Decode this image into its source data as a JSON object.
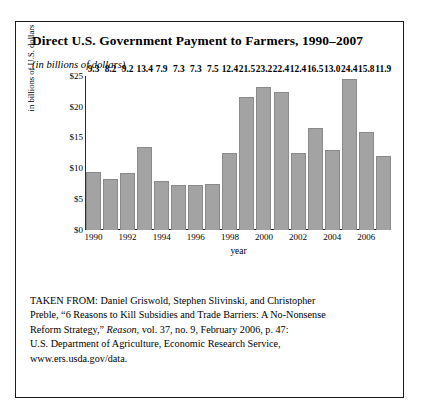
{
  "chart_title": "Direct U.S. Government Payment to Farmers, 1990–2007",
  "chart_subtitle": "(in billions of dollars)",
  "chart_data": {
    "type": "bar",
    "title": "Direct U.S. Government Payment to Farmers, 1990–2007",
    "subtitle": "(in billions of dollars)",
    "xlabel": "year",
    "ylabel": "in billions of U.S. dollars",
    "ylim": [
      0,
      25
    ],
    "yticks": [
      "$0",
      "$5",
      "$10",
      "$15",
      "$20",
      "$25"
    ],
    "ytick_values": [
      0,
      5,
      10,
      15,
      20,
      25
    ],
    "grid": false,
    "legend": "none",
    "bar_color": "#a3a3a3",
    "categories": [
      "1990",
      "1991",
      "1992",
      "1993",
      "1994",
      "1995",
      "1996",
      "1997",
      "1998",
      "1999",
      "2000",
      "2001",
      "2002",
      "2003",
      "2004",
      "2005",
      "2006",
      "2007"
    ],
    "visible_xtick_labels": [
      "1990",
      "",
      "1992",
      "",
      "1994",
      "",
      "1996",
      "",
      "1998",
      "",
      "2000",
      "",
      "2002",
      "",
      "2004",
      "",
      "2006",
      ""
    ],
    "values": [
      9.3,
      8.2,
      9.2,
      13.4,
      7.9,
      7.3,
      7.3,
      7.5,
      12.4,
      21.5,
      23.2,
      22.4,
      12.4,
      16.5,
      13.0,
      24.4,
      15.8,
      11.9
    ],
    "data_labels": [
      "9.3",
      "8.2",
      "9.2",
      "13.4",
      "7.9",
      "7.3",
      "7.3",
      "7.5",
      "12.4",
      "21.5",
      "23.2",
      "22.4",
      "12.4",
      "16.5",
      "13.0",
      "24.4",
      "15.8",
      "11.9"
    ]
  },
  "source": {
    "line1": "TAKEN FROM: Daniel Griswold, Stephen Slivinski, and Christopher",
    "line2_a": "Preble, “6 Reasons to Kill Subsidies and Trade Barriers: A No-Nonsense",
    "line3_a": "Reform Strategy,” ",
    "line3_italic": "Reason",
    "line3_b": ", vol. 37, no. 9, February 2006, p. 47:",
    "line4": "U.S. Department of Agriculture, Economic Research Service,",
    "line5": "www.ers.usda.gov/data."
  }
}
